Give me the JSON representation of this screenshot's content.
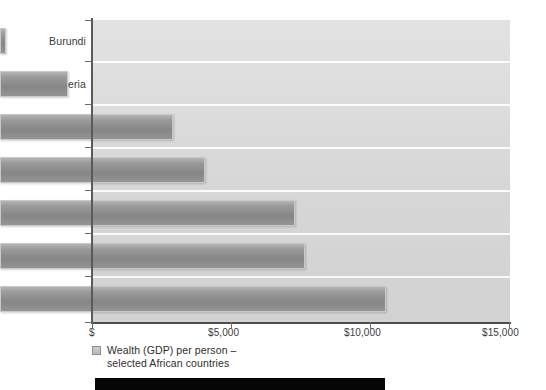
{
  "chart_data": {
    "type": "bar",
    "orientation": "horizontal",
    "title": "",
    "subtitle": "",
    "xlabel": "",
    "ylabel": "",
    "categories": [
      "Burundi",
      "Nigeria",
      "Egypt",
      "Algeria",
      "South Africa",
      "World average",
      "Libya"
    ],
    "values": [
      200,
      2450,
      6200,
      7350,
      10600,
      10950,
      13850
    ],
    "series": [
      {
        "name": "Wealth (GDP) per person – selected African countries",
        "values": [
          200,
          2450,
          6200,
          7350,
          10600,
          10950,
          13850
        ]
      }
    ],
    "xlim": [
      0,
      15000
    ],
    "xticks": [
      0,
      5000,
      10000,
      15000
    ],
    "xtick_labels": [
      "$",
      "$5,000",
      "$10,000",
      "$15,000"
    ],
    "grid": false,
    "legend_position": "below-axis",
    "bar_color": "#8e8e8e",
    "bar_border_color": "#c9c9c9",
    "plot_background": "#d6d6d6",
    "band_separator_color": "#fcfcfc",
    "axis_color": "#4d4d4d",
    "text_color": "#3b3b3b"
  },
  "axis": {
    "y_categories": [
      "Burundi",
      "Nigeria",
      "Egypt",
      "Algeria",
      "South Africa",
      "World average",
      "Libya"
    ],
    "x_labels": [
      "$",
      "$5,000",
      "$10,000",
      "$15,000"
    ]
  },
  "legend": {
    "label": "Wealth (GDP) per person –\nselected African countries",
    "swatch_name": "legend-swatch"
  }
}
